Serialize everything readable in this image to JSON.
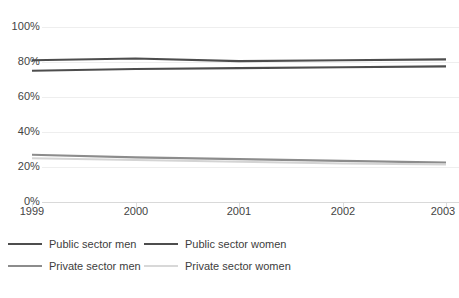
{
  "chart_data": {
    "type": "line",
    "title": "",
    "subtitle": "",
    "xlabel": "",
    "ylabel": "",
    "x": [
      1999,
      2000,
      2001,
      2002,
      2003
    ],
    "categories": [
      "1999",
      "2000",
      "2001",
      "2002",
      "2003"
    ],
    "xtick_labels": [
      "1999",
      "2000",
      "2001",
      "2002",
      "2003"
    ],
    "ytick_labels": [
      "100%",
      "80%",
      "60%",
      "40%",
      "20%",
      "0%"
    ],
    "ytick_values": [
      100,
      80,
      60,
      40,
      20,
      0
    ],
    "ylim": [
      0,
      100
    ],
    "xlim": [
      1999,
      2003
    ],
    "grid": true,
    "legend_position": "bottom-left",
    "units": "percent",
    "series": [
      {
        "name": "Public sector men",
        "color": "#4d4d4d",
        "values": [
          81,
          82,
          80.5,
          81,
          81.5
        ]
      },
      {
        "name": "Public sector women",
        "color": "#4d4d4d",
        "values": [
          75,
          76,
          76.5,
          77,
          77.5
        ]
      },
      {
        "name": "Private sector men",
        "color": "#8c8c8c",
        "values": [
          27,
          25.5,
          24.5,
          23.5,
          22.5
        ]
      },
      {
        "name": "Private sector women",
        "color": "#d4d4d4",
        "values": [
          25,
          24,
          23,
          22,
          21.5
        ]
      }
    ]
  },
  "axes": {
    "y_ticks": [
      {
        "label": "100%",
        "value": 100
      },
      {
        "label": "80%",
        "value": 80
      },
      {
        "label": "60%",
        "value": 60
      },
      {
        "label": "40%",
        "value": 40
      },
      {
        "label": "20%",
        "value": 20
      },
      {
        "label": "0%",
        "value": 0
      }
    ],
    "x_ticks": [
      {
        "label": "1999",
        "value": 1999
      },
      {
        "label": "2000",
        "value": 2000
      },
      {
        "label": "2001",
        "value": 2001
      },
      {
        "label": "2002",
        "value": 2002
      },
      {
        "label": "2003",
        "value": 2003
      }
    ]
  },
  "legend": {
    "items": [
      {
        "label": "Public sector men",
        "color": "#4d4d4d"
      },
      {
        "label": "Public sector women",
        "color": "#4d4d4d"
      },
      {
        "label": "Private sector men",
        "color": "#8c8c8c"
      },
      {
        "label": "Private sector women",
        "color": "#d8d8d8"
      }
    ]
  },
  "footnote": {
    "text": ""
  },
  "colors": {
    "gridline": "#eeeeee",
    "axis": "#d9d9d9",
    "text": "#3d3d3d",
    "background": "#ffffff"
  }
}
